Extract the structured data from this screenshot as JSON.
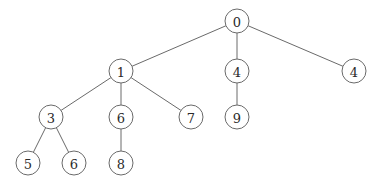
{
  "diagram": {
    "type": "tree",
    "node_radius": 12,
    "colors": {
      "edge": "#6a6a6a",
      "node_stroke": "#6a6a6a",
      "node_fill": "#ffffff",
      "label": "#2a2a2a"
    },
    "nodes": [
      {
        "id": "n0",
        "label": "0",
        "x": 237,
        "y": 21
      },
      {
        "id": "n1",
        "label": "1",
        "x": 121,
        "y": 71
      },
      {
        "id": "n2",
        "label": "4",
        "x": 237,
        "y": 71
      },
      {
        "id": "n3",
        "label": "4",
        "x": 354,
        "y": 71
      },
      {
        "id": "n4",
        "label": "3",
        "x": 51,
        "y": 117
      },
      {
        "id": "n5",
        "label": "6",
        "x": 121,
        "y": 117
      },
      {
        "id": "n6",
        "label": "7",
        "x": 191,
        "y": 117
      },
      {
        "id": "n7",
        "label": "9",
        "x": 237,
        "y": 117
      },
      {
        "id": "n8",
        "label": "5",
        "x": 28,
        "y": 163
      },
      {
        "id": "n9",
        "label": "6",
        "x": 74,
        "y": 163
      },
      {
        "id": "n10",
        "label": "8",
        "x": 121,
        "y": 163
      }
    ],
    "edges": [
      [
        "n0",
        "n1"
      ],
      [
        "n0",
        "n2"
      ],
      [
        "n0",
        "n3"
      ],
      [
        "n1",
        "n4"
      ],
      [
        "n1",
        "n5"
      ],
      [
        "n1",
        "n6"
      ],
      [
        "n2",
        "n7"
      ],
      [
        "n4",
        "n8"
      ],
      [
        "n4",
        "n9"
      ],
      [
        "n5",
        "n10"
      ]
    ]
  }
}
